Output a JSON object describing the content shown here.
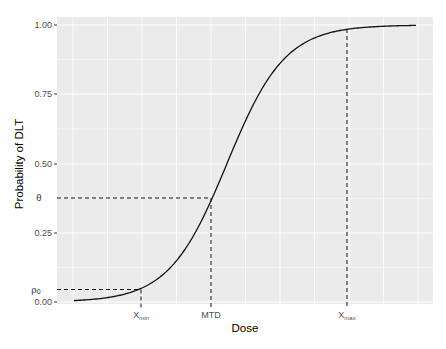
{
  "chart_data": {
    "type": "line",
    "title": "",
    "xlabel": "Dose",
    "ylabel": "Probability of DLT",
    "ylim": [
      0,
      1
    ],
    "y_ticks": [
      "0.00",
      "0.25",
      "0.50",
      "0.75",
      "1.00"
    ],
    "y_tick_values": [
      0,
      0.25,
      0.5,
      0.75,
      1.0
    ],
    "x_ticks": [
      {
        "label": "X",
        "sub": "min"
      },
      {
        "label": "MTD",
        "sub": ""
      },
      {
        "label": "X",
        "sub": "max"
      }
    ],
    "grid": true,
    "legend": null,
    "series": [
      {
        "name": "dose-toxicity curve",
        "shape": "logistic",
        "description": "monotone increasing S-curve from ~0 to ~1"
      }
    ],
    "annotations": [
      {
        "label": "ρ0",
        "y": 0.045,
        "x_ref": "Xmin",
        "style": "dashed"
      },
      {
        "label": "θ",
        "y": 0.375,
        "x_ref": "MTD",
        "style": "dashed"
      },
      {
        "label": "",
        "y": 0.985,
        "x_ref": "Xmax",
        "style": "dashed"
      }
    ]
  },
  "labels": {
    "xlabel": "Dose",
    "ylabel": "Probability of DLT",
    "yticks": [
      "0.00",
      "0.25",
      "0.50",
      "0.75",
      "1.00"
    ],
    "xtick_xmin": "X",
    "xtick_xmin_sub": "min",
    "xtick_mtd": "MTD",
    "xtick_xmax": "X",
    "xtick_xmax_sub": "max",
    "theta": "θ",
    "rho0": "ρ",
    "rho0_sub": "0"
  }
}
